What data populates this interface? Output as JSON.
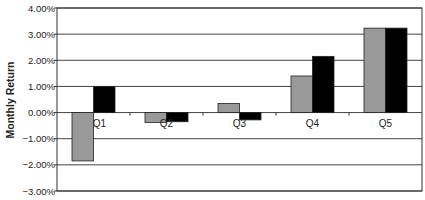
{
  "chart_data": {
    "type": "bar",
    "title": "",
    "xlabel": "",
    "ylabel": "Monthly Return",
    "categories": [
      "Q1",
      "Q2",
      "Q3",
      "Q4",
      "Q5"
    ],
    "series": [
      {
        "name": "Series 1 (gray)",
        "color": "#999999",
        "values": [
          -1.85,
          -0.38,
          0.35,
          1.4,
          3.23
        ]
      },
      {
        "name": "Series 2 (black)",
        "color": "#000000",
        "values": [
          1.0,
          -0.35,
          -0.28,
          2.15,
          3.23
        ]
      }
    ],
    "ylim": [
      -3.0,
      4.0
    ],
    "yticks": [
      "4.00%",
      "3.00%",
      "2.00%",
      "1.00%",
      "0.00%",
      "-1.00%",
      "-2.00%",
      "-3.00%"
    ],
    "ytick_values": [
      4,
      3,
      2,
      1,
      0,
      -1,
      -2,
      -3
    ],
    "grid": true,
    "legend": "none"
  }
}
